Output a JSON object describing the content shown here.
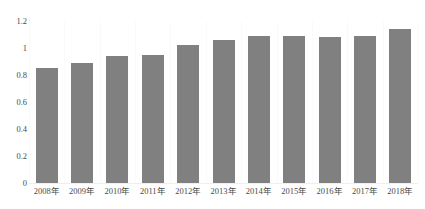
{
  "chart_data": {
    "type": "bar",
    "title": "",
    "subtitle": "",
    "xlabel": "",
    "ylabel": "",
    "categories": [
      "2008年",
      "2009年",
      "2010年",
      "2011年",
      "2012年",
      "2013年",
      "2014年",
      "2015年",
      "2016年",
      "2017年",
      "2018年"
    ],
    "values": [
      0.85,
      0.89,
      0.94,
      0.95,
      1.02,
      1.06,
      1.09,
      1.09,
      1.08,
      1.09,
      1.14
    ],
    "series": [
      {
        "name": "",
        "values": [
          0.85,
          0.89,
          0.94,
          0.95,
          1.02,
          1.06,
          1.09,
          1.09,
          1.08,
          1.09,
          1.14
        ]
      }
    ],
    "ylim": [
      0,
      1.2
    ],
    "y_ticks": [
      0,
      0.2,
      0.4,
      0.6,
      0.8,
      1,
      1.2
    ],
    "y_tick_labels": [
      "0",
      "0.2",
      "0.4",
      "0.6",
      "0.8",
      "1",
      "1.2"
    ],
    "grid": "vertical-faint",
    "legend": "none",
    "bar_color": "#808080",
    "axis_color": "#e9e9e9",
    "text_color": "#4a4a4a"
  }
}
